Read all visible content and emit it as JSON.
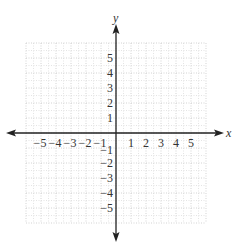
{
  "diagram": {
    "type": "coordinate-plane",
    "x_axis_label": "x",
    "y_axis_label": "y",
    "x_tick_labels": [
      "−5",
      "−4",
      "−3",
      "−2",
      "−1",
      "1",
      "2",
      "3",
      "4",
      "5"
    ],
    "y_tick_labels": [
      "5",
      "4",
      "3",
      "2",
      "1",
      "−1",
      "−2",
      "−3",
      "−4",
      "−5"
    ],
    "x_range": [
      -6,
      6
    ],
    "y_range": [
      -6,
      6
    ],
    "grid": "dotted, unit and half-unit lines",
    "colors": {
      "axis": "#222222",
      "grid_major": "#c8c8c8",
      "grid_minor": "#dddddd",
      "label": "#333333"
    }
  }
}
